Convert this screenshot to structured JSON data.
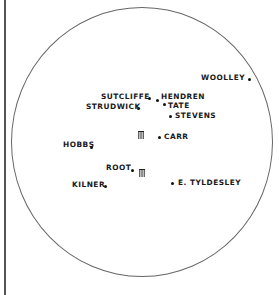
{
  "diagram": {
    "title": "",
    "type": "cricket-field-placement",
    "colors": {
      "ink": "#1a1a1a",
      "boundary": "#666666",
      "margin_line": "#555555"
    },
    "wickets": [
      {
        "id": "bowler-end",
        "icon": "wicket-stumps-icon",
        "x": 138,
        "y": 124
      },
      {
        "id": "striker-end",
        "icon": "wicket-stumps-icon",
        "x": 139,
        "y": 162
      }
    ],
    "fielders": [
      {
        "name": "WOOLLEY",
        "label_x": 201,
        "label_y": 73,
        "dot_x": 248,
        "dot_y": 78,
        "label_side": "left"
      },
      {
        "name": "SUTCLIFFE",
        "label_x": 101,
        "label_y": 92,
        "dot_x": 148,
        "dot_y": 97,
        "label_side": "left"
      },
      {
        "name": "HENDREN",
        "label_x": 161,
        "label_y": 92,
        "dot_x": 156,
        "dot_y": 99,
        "label_side": "right"
      },
      {
        "name": "STRUDWICK",
        "label_x": 86,
        "label_y": 102,
        "dot_x": 137,
        "dot_y": 107,
        "label_side": "left"
      },
      {
        "name": "TATE",
        "label_x": 168,
        "label_y": 101,
        "dot_x": 163,
        "dot_y": 103,
        "label_side": "right"
      },
      {
        "name": "STEVENS",
        "label_x": 175,
        "label_y": 111,
        "dot_x": 169,
        "dot_y": 115,
        "label_side": "right"
      },
      {
        "name": "CARR",
        "label_x": 164,
        "label_y": 132,
        "dot_x": 158,
        "dot_y": 136,
        "label_side": "right"
      },
      {
        "name": "HOBBS",
        "label_x": 63,
        "label_y": 140,
        "dot_x": 90,
        "dot_y": 146,
        "label_side": "left"
      },
      {
        "name": "ROOT",
        "label_x": 106,
        "label_y": 163,
        "dot_x": 131,
        "dot_y": 169,
        "label_side": "left"
      },
      {
        "name": "KILNER",
        "label_x": 72,
        "label_y": 180,
        "dot_x": 104,
        "dot_y": 185,
        "label_side": "left"
      },
      {
        "name": "E. TYLDESLEY",
        "label_x": 178,
        "label_y": 178,
        "dot_x": 171,
        "dot_y": 182,
        "label_side": "right"
      }
    ]
  }
}
